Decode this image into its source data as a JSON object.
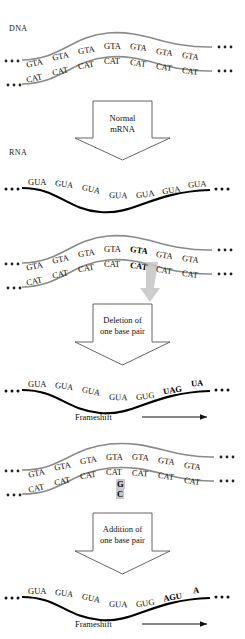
{
  "figure": {
    "labels": {
      "dna": "DNA",
      "rna": "RNA",
      "frameshift": "Frameshift"
    },
    "colors": {
      "strand_dna": "#8a8a8a",
      "strand_rna": "#000000",
      "text": "#111111",
      "highlight": "#c9c9c9",
      "arrow_outline": "#555555",
      "mutation_arrow": "#bdbdbd"
    }
  },
  "panels": [
    {
      "id": "dna-normal",
      "kind": "dna",
      "label": "DNA",
      "top_strand": [
        "GTA",
        "GTA",
        "GTA",
        "GTA",
        "GTA",
        "GTA",
        "GTA"
      ],
      "bottom_strand": [
        "CAT",
        "CAT",
        "CAT",
        "CAT",
        "CAT",
        "CAT",
        "CAT"
      ],
      "bold_index": null,
      "ellipsis_left": "...",
      "ellipsis_right": "..."
    },
    {
      "id": "arrow-normal",
      "kind": "arrow",
      "lines": [
        "Normal",
        "mRNA"
      ]
    },
    {
      "id": "rna-normal",
      "kind": "rna",
      "label": "RNA",
      "codons": [
        "GUA",
        "GUA",
        "GUA",
        "GUA",
        "GUA",
        "GUA",
        "GUA"
      ],
      "bold_from": null,
      "frameshift": false,
      "ellipsis_left": "...",
      "ellipsis_right": "..."
    },
    {
      "id": "dna-deletion",
      "kind": "dna",
      "label": "",
      "top_strand": [
        "GTA",
        "GTA",
        "GTA",
        "GTA",
        "GTA",
        "GTA",
        "GTA"
      ],
      "bottom_strand": [
        "CAT",
        "CAT",
        "CAT",
        "CAT",
        "CAT",
        "CAT",
        "CAT"
      ],
      "bold_index": 4,
      "bold_top_char": "A",
      "bold_bottom_char": "T",
      "mutation_marker": "deletion-arrow",
      "ellipsis_left": "...",
      "ellipsis_right": "..."
    },
    {
      "id": "arrow-deletion",
      "kind": "arrow",
      "lines": [
        "Deletion of",
        "one base pair"
      ]
    },
    {
      "id": "rna-deletion",
      "kind": "rna",
      "label": "",
      "codons": [
        "GUA",
        "GUA",
        "GUA",
        "GUA",
        "GUG",
        "UAG",
        "UA"
      ],
      "bold_from": 5,
      "frameshift": true,
      "frameshift_label": "Frameshift",
      "ellipsis_left": "...",
      "ellipsis_right": "..."
    },
    {
      "id": "dna-addition",
      "kind": "dna",
      "label": "",
      "top_strand": [
        "GTA",
        "GTA",
        "GTA",
        "GTA",
        "GTA",
        "GTA",
        "GTA"
      ],
      "bottom_strand": [
        "CAT",
        "CAT",
        "CAT",
        "CAT",
        "CAT",
        "CAT",
        "CAT"
      ],
      "inserted_pair": {
        "top": "G",
        "bottom": "C"
      },
      "mutation_marker": "insertion-pair",
      "ellipsis_left": "...",
      "ellipsis_right": "..."
    },
    {
      "id": "arrow-addition",
      "kind": "arrow",
      "lines": [
        "Addition of",
        "one base pair"
      ]
    },
    {
      "id": "rna-addition",
      "kind": "rna",
      "label": "",
      "codons": [
        "GUA",
        "GUA",
        "GUA",
        "GUA",
        "GUG",
        "AGU",
        "A"
      ],
      "bold_from": 5,
      "frameshift": true,
      "frameshift_label": "Frameshift",
      "ellipsis_left": "...",
      "ellipsis_right": "..."
    }
  ]
}
